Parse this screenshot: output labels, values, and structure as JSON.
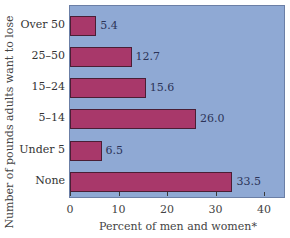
{
  "chart_data": {
    "type": "bar",
    "orientation": "horizontal",
    "title": "",
    "xlabel": "Percent of men and women*",
    "ylabel": "Number of pounds adults want to lose",
    "categories": [
      "Over 50",
      "25–50",
      "15–24",
      "5–14",
      "Under 5",
      "None"
    ],
    "values": [
      5.4,
      12.7,
      15.6,
      26.0,
      6.5,
      33.5
    ],
    "value_labels": [
      "5.4",
      "12.7",
      "15.6",
      "26.0",
      "6.5",
      "33.5"
    ],
    "xticks": [
      "0",
      "10",
      "20",
      "30",
      "40"
    ],
    "xlim": [
      0,
      44
    ],
    "grid": false,
    "legend": null,
    "colors": {
      "bar": "#a8386a",
      "plot_background": "#8fa9d4"
    }
  }
}
